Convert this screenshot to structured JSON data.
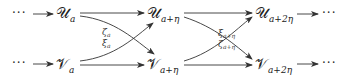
{
  "diagram": {
    "type": "commutative-diagram",
    "ellipsis": "···",
    "top_row": [
      {
        "symbol": "𝒰",
        "subscript": "a"
      },
      {
        "symbol": "𝒰",
        "subscript": "a+η"
      },
      {
        "symbol": "𝒰",
        "subscript": "a+2η"
      }
    ],
    "bottom_row": [
      {
        "symbol": "𝒱",
        "subscript": "a"
      },
      {
        "symbol": "𝒱",
        "subscript": "a+η"
      },
      {
        "symbol": "𝒱",
        "subscript": "a+2η"
      }
    ],
    "crossing_labels": [
      {
        "top": {
          "symbol": "ζ",
          "subscript": "a"
        },
        "bottom": {
          "symbol": "ξ",
          "subscript": "a"
        }
      },
      {
        "top": {
          "symbol": "ξ",
          "subscript": "a+η"
        },
        "bottom": {
          "symbol": "ζ",
          "subscript": "a+η"
        }
      }
    ],
    "stroke_color": "#333333"
  }
}
